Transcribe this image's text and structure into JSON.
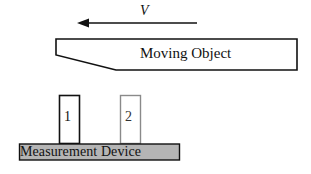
{
  "velocity": {
    "label": "V",
    "direction": "left"
  },
  "moving_object": {
    "label": "Moving Object"
  },
  "sensors": [
    {
      "label": "1",
      "border_color": "#111111"
    },
    {
      "label": "2",
      "border_color": "#888888"
    }
  ],
  "measurement_device": {
    "label": "Measurement Device",
    "fill_color": "#b5b5b5"
  }
}
